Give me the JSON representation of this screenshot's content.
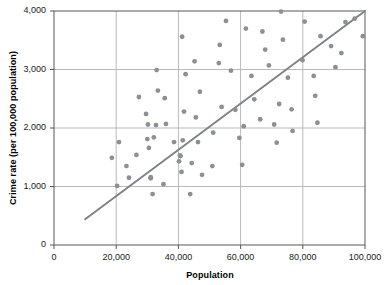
{
  "chart_data": {
    "type": "scatter",
    "title": "",
    "xlabel": "Population",
    "ylabel": "Crime rate (per 100,000 population)",
    "xlim": [
      0,
      100000
    ],
    "ylim": [
      0,
      4000
    ],
    "xticks": [
      0,
      20000,
      40000,
      60000,
      80000,
      100000
    ],
    "yticks": [
      0,
      1000,
      2000,
      3000,
      4000
    ],
    "xtick_labels": [
      "0",
      "20,000",
      "40,000",
      "60,000",
      "80,000",
      "100,000"
    ],
    "ytick_labels": [
      "0",
      "1,000",
      "2,000",
      "3,000",
      "4,000"
    ],
    "grid": "both-inner-gridlines",
    "legend": "none",
    "marker_color": "#8b9096",
    "marker_size_px": 4.6,
    "line_color": "#7d8287",
    "series": [
      {
        "name": "Cities",
        "type": "scatter",
        "points": [
          [
            18600,
            1490
          ],
          [
            20300,
            1010
          ],
          [
            20900,
            1760
          ],
          [
            23300,
            1350
          ],
          [
            24100,
            1150
          ],
          [
            26500,
            1540
          ],
          [
            27300,
            2530
          ],
          [
            29600,
            2240
          ],
          [
            30000,
            1810
          ],
          [
            30200,
            2060
          ],
          [
            30500,
            1660
          ],
          [
            31100,
            1140
          ],
          [
            31100,
            1160
          ],
          [
            31700,
            870
          ],
          [
            32100,
            1840
          ],
          [
            32800,
            2050
          ],
          [
            33000,
            2990
          ],
          [
            33400,
            2640
          ],
          [
            35200,
            1040
          ],
          [
            35600,
            2510
          ],
          [
            36000,
            2070
          ],
          [
            38600,
            1760
          ],
          [
            40200,
            1430
          ],
          [
            40500,
            1530
          ],
          [
            40700,
            1520
          ],
          [
            41000,
            1250
          ],
          [
            41200,
            3560
          ],
          [
            41400,
            1790
          ],
          [
            41800,
            2280
          ],
          [
            42300,
            2920
          ],
          [
            43800,
            870
          ],
          [
            44300,
            1400
          ],
          [
            45200,
            3140
          ],
          [
            45600,
            2180
          ],
          [
            46300,
            1760
          ],
          [
            46900,
            2620
          ],
          [
            47600,
            1200
          ],
          [
            50900,
            1350
          ],
          [
            51200,
            1920
          ],
          [
            53000,
            3110
          ],
          [
            53300,
            3420
          ],
          [
            53900,
            2360
          ],
          [
            55300,
            3830
          ],
          [
            56900,
            2980
          ],
          [
            58300,
            2310
          ],
          [
            59600,
            1830
          ],
          [
            60500,
            1370
          ],
          [
            61000,
            2030
          ],
          [
            61700,
            3700
          ],
          [
            63500,
            2890
          ],
          [
            64400,
            2490
          ],
          [
            66300,
            2150
          ],
          [
            67000,
            3650
          ],
          [
            67900,
            3340
          ],
          [
            69100,
            3070
          ],
          [
            70800,
            2060
          ],
          [
            71600,
            1750
          ],
          [
            72400,
            2410
          ],
          [
            73000,
            3990
          ],
          [
            73600,
            3510
          ],
          [
            75200,
            2860
          ],
          [
            76400,
            2320
          ],
          [
            76700,
            1950
          ],
          [
            79900,
            3160
          ],
          [
            80600,
            3820
          ],
          [
            83500,
            2890
          ],
          [
            84000,
            2550
          ],
          [
            84700,
            2090
          ],
          [
            85700,
            3570
          ],
          [
            89100,
            3400
          ],
          [
            90500,
            3040
          ],
          [
            92400,
            3280
          ],
          [
            93700,
            3810
          ],
          [
            96700,
            3870
          ],
          [
            99300,
            3570
          ]
        ]
      },
      {
        "name": "Regression line",
        "type": "line",
        "points": [
          [
            10000,
            440
          ],
          [
            100000,
            4000
          ]
        ]
      }
    ]
  }
}
